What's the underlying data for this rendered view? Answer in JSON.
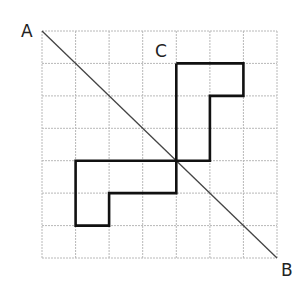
{
  "diagram": {
    "grid": {
      "cols": 7,
      "rows": 7,
      "origin": [
        42,
        31
      ],
      "cell_w": 33.57,
      "cell_h": 32.43,
      "line_color": "#b8b8b8"
    },
    "labels": {
      "a": "A",
      "b": "B",
      "c": "C"
    },
    "diagonal": {
      "from": "A",
      "to": "B",
      "color": "#444444"
    },
    "shape": {
      "color": "#111111",
      "upper_part_grid_points": [
        [
          4,
          1
        ],
        [
          6,
          1
        ],
        [
          6,
          2
        ],
        [
          5,
          2
        ],
        [
          5,
          4
        ],
        [
          4,
          4
        ],
        [
          4,
          1
        ]
      ],
      "lower_part_grid_points": [
        [
          4,
          4
        ],
        [
          1,
          4
        ],
        [
          1,
          6
        ],
        [
          2,
          6
        ],
        [
          2,
          5
        ],
        [
          4,
          5
        ],
        [
          4,
          4
        ]
      ]
    }
  }
}
